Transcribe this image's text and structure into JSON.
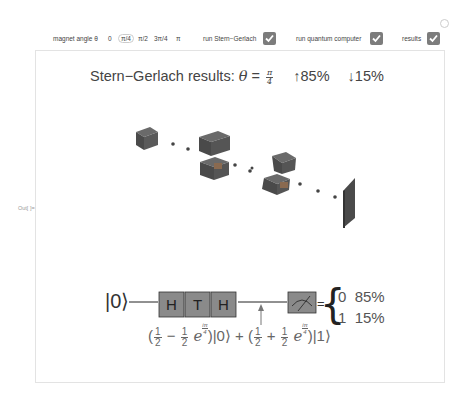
{
  "controls": {
    "angle_label": "magnet angle θ",
    "angle_options": [
      "0",
      "π/4",
      "π/2",
      "3π/4",
      "π"
    ],
    "selected_angle": "π/4",
    "checkboxes": [
      {
        "label": "run Stern−Gerlach",
        "checked": true
      },
      {
        "label": "run quantum computer",
        "checked": true
      },
      {
        "label": "results",
        "checked": true
      }
    ]
  },
  "output_label": "Out[ ]=",
  "title": {
    "prefix": "Stern−Gerlach results: ",
    "theta": "θ",
    "equals": " = ",
    "frac_num": "π",
    "frac_den": "4",
    "up": "↑85%",
    "down": "↓15%"
  },
  "circuit": {
    "input_ket": "|0⟩",
    "gates": [
      "H",
      "T",
      "H"
    ],
    "equals": "=",
    "results": [
      {
        "outcome": "0",
        "percent": "85%"
      },
      {
        "outcome": "1",
        "percent": "15%"
      }
    ],
    "state": {
      "term1": {
        "a_num": "1",
        "a_den": "2",
        "sign": "−",
        "b_num": "1",
        "b_den": "2",
        "exp_base": "e",
        "exp_num": "iπ",
        "exp_den": "4",
        "ket": "|0⟩"
      },
      "plus": "+",
      "term2": {
        "a_num": "1",
        "a_den": "2",
        "sign": "+",
        "b_num": "1",
        "b_den": "2",
        "exp_base": "e",
        "exp_num": "iπ",
        "exp_den": "4",
        "ket": "|1⟩"
      }
    }
  },
  "colors": {
    "checkbox": "#7c7c7c",
    "gate_fill": "#8a8a8a",
    "device_dark": "#4a4a4a"
  }
}
